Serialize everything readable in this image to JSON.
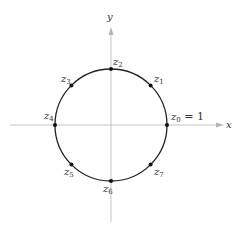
{
  "diagram": {
    "type": "roots-of-unity-on-unit-circle",
    "axes": {
      "x_label": "x",
      "y_label": "y",
      "axis_color": "#b0b0b0"
    },
    "circle": {
      "stroke": "#222222"
    },
    "points": [
      {
        "name": "z",
        "sub": "0",
        "suffix": " = 1"
      },
      {
        "name": "z",
        "sub": "1",
        "suffix": ""
      },
      {
        "name": "z",
        "sub": "2",
        "suffix": ""
      },
      {
        "name": "z",
        "sub": "3",
        "suffix": ""
      },
      {
        "name": "z",
        "sub": "4",
        "suffix": ""
      },
      {
        "name": "z",
        "sub": "5",
        "suffix": ""
      },
      {
        "name": "z",
        "sub": "6",
        "suffix": ""
      },
      {
        "name": "z",
        "sub": "7",
        "suffix": ""
      }
    ]
  }
}
